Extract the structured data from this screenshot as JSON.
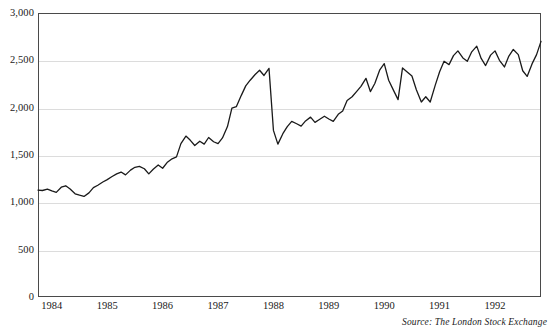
{
  "chart_data": {
    "type": "line",
    "title": "",
    "subtitle": "",
    "xlabel": "",
    "ylabel": "",
    "source_note": "Source: The London Stock Exchange",
    "grid": true,
    "legend": "none",
    "series_color": "#1a1a1a",
    "grid_color": "#dcdcdc",
    "frame_color": "#4a4a4a",
    "ylim": [
      0,
      3000
    ],
    "yticks": [
      0,
      500,
      1000,
      1500,
      2000,
      2500,
      3000
    ],
    "ytick_labels": [
      "0",
      "500",
      "1,000",
      "1,500",
      "2,000",
      "2,500",
      "3,000"
    ],
    "xlim": [
      1983.75,
      1992.83
    ],
    "xticks": [
      1984,
      1985,
      1986,
      1987,
      1988,
      1989,
      1990,
      1991,
      1992
    ],
    "xtick_labels": [
      "1984",
      "1985",
      "1986",
      "1987",
      "1988",
      "1989",
      "1990",
      "1991",
      "1992"
    ],
    "series": [
      {
        "name": "FTSE 100 Index",
        "x": [
          1983.75,
          1983.83,
          1983.92,
          1984.0,
          1984.08,
          1984.17,
          1984.25,
          1984.33,
          1984.42,
          1984.5,
          1984.58,
          1984.67,
          1984.75,
          1984.83,
          1984.92,
          1985.0,
          1985.08,
          1985.17,
          1985.25,
          1985.33,
          1985.42,
          1985.5,
          1985.58,
          1985.67,
          1985.75,
          1985.83,
          1985.92,
          1986.0,
          1986.08,
          1986.17,
          1986.25,
          1986.33,
          1986.42,
          1986.5,
          1986.58,
          1986.67,
          1986.75,
          1986.83,
          1986.92,
          1987.0,
          1987.08,
          1987.17,
          1987.25,
          1987.33,
          1987.42,
          1987.5,
          1987.58,
          1987.67,
          1987.75,
          1987.83,
          1987.92,
          1988.0,
          1988.08,
          1988.17,
          1988.25,
          1988.33,
          1988.42,
          1988.5,
          1988.58,
          1988.67,
          1988.75,
          1988.83,
          1988.92,
          1989.0,
          1989.08,
          1989.17,
          1989.25,
          1989.33,
          1989.42,
          1989.5,
          1989.58,
          1989.67,
          1989.75,
          1989.83,
          1989.92,
          1990.0,
          1990.08,
          1990.17,
          1990.25,
          1990.33,
          1990.42,
          1990.5,
          1990.58,
          1990.67,
          1990.75,
          1990.83,
          1990.92,
          1991.0,
          1991.08,
          1991.17,
          1991.25,
          1991.33,
          1991.42,
          1991.5,
          1991.58,
          1991.67,
          1991.75,
          1991.83,
          1991.92,
          1992.0,
          1992.08,
          1992.17,
          1992.25,
          1992.33,
          1992.42,
          1992.5,
          1992.58,
          1992.67,
          1992.75,
          1992.83
        ],
        "values": [
          1130,
          1125,
          1140,
          1120,
          1105,
          1160,
          1175,
          1140,
          1090,
          1075,
          1062,
          1100,
          1155,
          1180,
          1215,
          1240,
          1270,
          1300,
          1320,
          1290,
          1340,
          1370,
          1380,
          1355,
          1300,
          1350,
          1395,
          1360,
          1420,
          1460,
          1480,
          1620,
          1700,
          1655,
          1600,
          1645,
          1615,
          1685,
          1640,
          1620,
          1680,
          1800,
          1995,
          2010,
          2130,
          2230,
          2290,
          2350,
          2395,
          2340,
          2415,
          1760,
          1615,
          1725,
          1800,
          1855,
          1830,
          1805,
          1860,
          1900,
          1845,
          1875,
          1910,
          1880,
          1855,
          1930,
          1965,
          2075,
          2115,
          2170,
          2225,
          2310,
          2170,
          2255,
          2400,
          2465,
          2290,
          2180,
          2085,
          2420,
          2375,
          2335,
          2190,
          2060,
          2115,
          2060,
          2235,
          2380,
          2490,
          2455,
          2550,
          2600,
          2525,
          2490,
          2590,
          2650,
          2520,
          2445,
          2555,
          2600,
          2500,
          2430,
          2545,
          2615,
          2560,
          2390,
          2330,
          2465,
          2560,
          2700
        ]
      }
    ]
  }
}
